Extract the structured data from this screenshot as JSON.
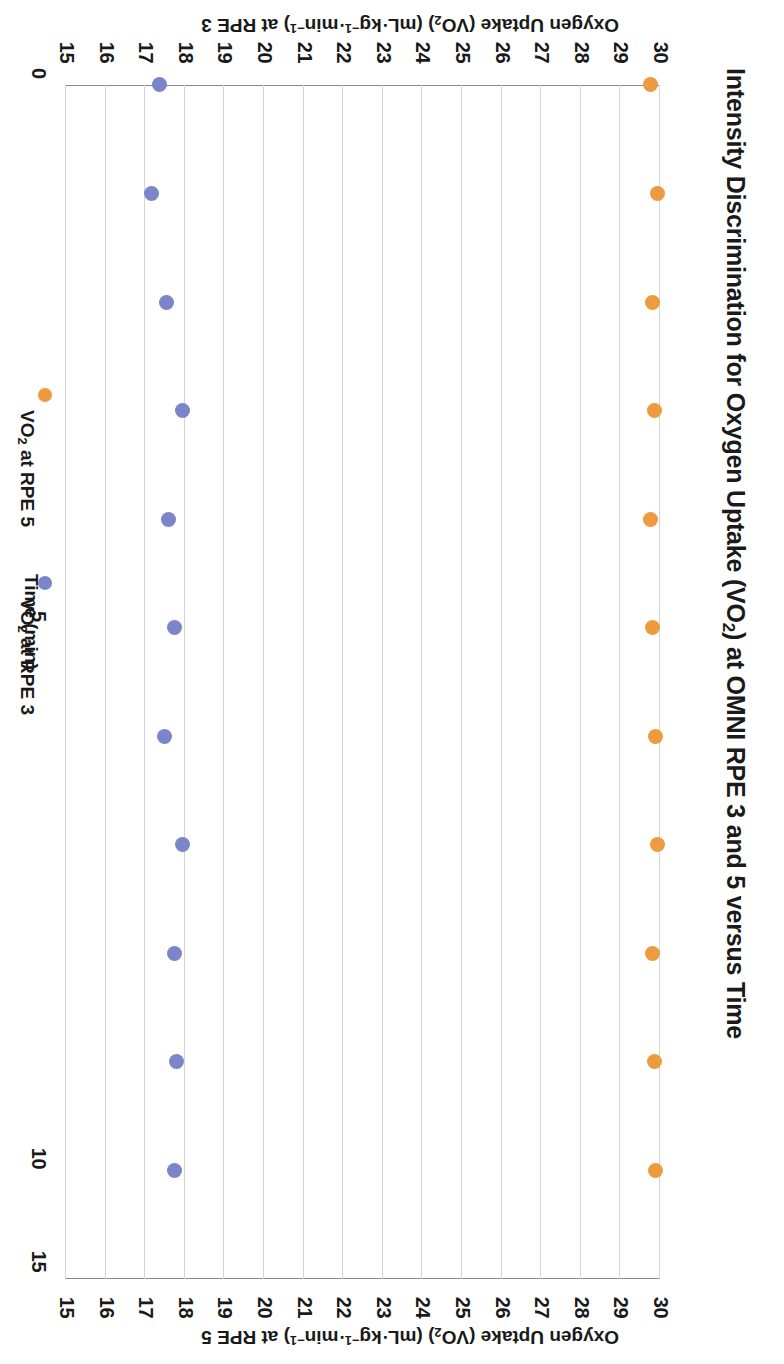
{
  "chart_data": {
    "type": "scatter",
    "title": "Intensity Discrimination for Oxygen Uptake (VO2) at OMNI RPE 3 and 5 versus Time",
    "xlabel": "Time (min)",
    "ylabel_primary": "Oxygen Uptake (VO2) (mL·kg-1·min-1) at RPE 3",
    "ylabel_secondary": "Oxygen Uptake (VO2) (mL·kg-1·min-1) at RPE 5",
    "xlim": [
      0,
      11
    ],
    "ylim": [
      15,
      30
    ],
    "xticks": [
      "0",
      "5",
      "10"
    ],
    "xtick_values": [
      0,
      5,
      10
    ],
    "yticks": [
      "15",
      "16",
      "17",
      "18",
      "19",
      "20",
      "21",
      "22",
      "23",
      "24",
      "25",
      "26",
      "27",
      "28",
      "29",
      "30"
    ],
    "grid": true,
    "legend_position": "bottom",
    "x": [
      0,
      1,
      2,
      3,
      4,
      5,
      6,
      7,
      8,
      9,
      10
    ],
    "series": [
      {
        "name": "VO2 at RPE 5",
        "color": "#EE9A3F",
        "values": [
          29.75,
          29.95,
          29.8,
          29.85,
          29.75,
          29.8,
          29.9,
          29.95,
          29.8,
          29.85,
          29.9
        ]
      },
      {
        "name": "VO2 at RPE 3",
        "color": "#7B86CA",
        "values": [
          17.35,
          17.15,
          17.55,
          17.95,
          17.6,
          17.75,
          17.5,
          17.95,
          17.75,
          17.8,
          17.75
        ]
      }
    ]
  },
  "axis": {
    "y_ticks": [
      "30",
      "29",
      "28",
      "27",
      "26",
      "25",
      "24",
      "23",
      "22",
      "21",
      "20",
      "19",
      "18",
      "17",
      "16",
      "15"
    ],
    "x_ticks": [
      "0",
      "5",
      "10"
    ],
    "x_origin_label": "15",
    "x_title": "Time (min)"
  },
  "labels": {
    "title_pre": "Intensity Discrimination for Oxygen Uptake (VO",
    "title_sub": "2",
    "title_post": ") at OMNI RPE 3 and 5 versus Time",
    "ylabel3_a": "Oxygen Uptake (VO",
    "ylabel3_sub": "2",
    "ylabel3_b": ") (mL·kg",
    "ylabel3_sup1": "−1",
    "ylabel3_c": "·min",
    "ylabel3_sup2": "−1",
    "ylabel3_d": ") at RPE 3",
    "ylabel5_d": ") at RPE 5"
  },
  "legend": {
    "items": [
      {
        "label_a": "VO",
        "label_sub": "2",
        "label_b": " at RPE 5",
        "color": "#EE9A3F"
      },
      {
        "label_a": "VO",
        "label_sub": "2",
        "label_b": " at RPE 3",
        "color": "#7B86CA"
      }
    ]
  }
}
